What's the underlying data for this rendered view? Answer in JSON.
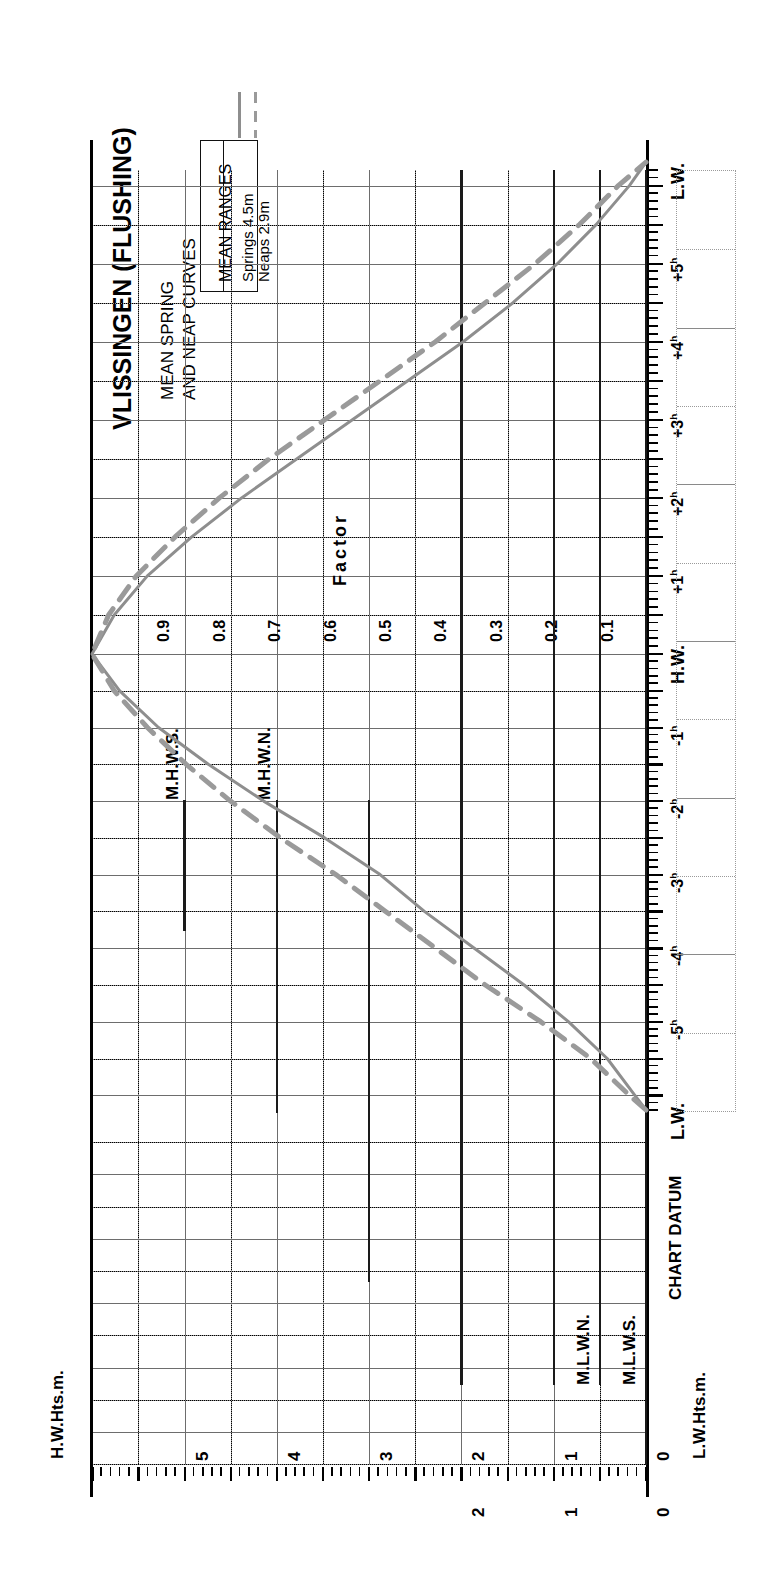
{
  "title": "VLISSINGEN (FLUSHING)",
  "subtitle_line1": "MEAN SPRING",
  "subtitle_line2": "AND NEAP CURVES",
  "legend": {
    "header": "MEAN RANGES",
    "springs_label": "Springs 4.5m",
    "neaps_label": "Neaps  2.9m",
    "springs_style": "solid",
    "neaps_style": "dashed",
    "springs_color": "#8e8e8e",
    "neaps_color": "#9a9a9a"
  },
  "axes": {
    "hw_height_axis_label": "H.W.Hts.m.",
    "lw_height_axis_label": "L.W.Hts.m.",
    "factor_axis_label": "Factor",
    "hw_height_ticks": [
      "0",
      "1",
      "2",
      "3",
      "4",
      "5"
    ],
    "lw_height_ticks": [
      "0",
      "1",
      "2"
    ],
    "factor_ticks": [
      "0.1",
      "0.2",
      "0.3",
      "0.4",
      "0.5",
      "0.6",
      "0.7",
      "0.8",
      "0.9"
    ],
    "time_ticks": [
      "L.W.",
      "+5",
      "+4",
      "+3",
      "+2",
      "+1",
      "H.W.",
      "-1",
      "-2",
      "-3",
      "-4",
      "-5",
      "L.W."
    ],
    "time_unit_superscript": "h"
  },
  "reference_lines": [
    {
      "label": "M.H.W.S.",
      "value": 5.0,
      "side": "hw"
    },
    {
      "label": "M.H.W.N.",
      "value": 4.0,
      "side": "hw"
    },
    {
      "label": "M.L.W.N.",
      "value": 1.0,
      "side": "lw"
    },
    {
      "label": "M.L.W.S.",
      "value": 0.5,
      "side": "lw"
    },
    {
      "label": "CHART DATUM",
      "value": 0.0,
      "side": "datum"
    }
  ],
  "chart_data": {
    "type": "line",
    "xlabel": "Factor",
    "ylabel": "Hours relative to High Water",
    "orientation": "rotated-90",
    "xlim": [
      0,
      1
    ],
    "ylim": [
      -6.2,
      6.3
    ],
    "grid": true,
    "legend_position": "top-left",
    "x": [
      -6.2,
      -6.0,
      -5.5,
      -5.0,
      -4.5,
      -4.0,
      -3.5,
      -3.0,
      -2.5,
      -2.0,
      -1.5,
      -1.0,
      -0.5,
      0.0,
      0.5,
      1.0,
      1.5,
      2.0,
      2.5,
      3.0,
      3.5,
      4.0,
      4.5,
      5.0,
      5.5,
      6.0,
      6.3
    ],
    "series": [
      {
        "name": "Springs 4.5m",
        "style": "solid",
        "color": "#8e8e8e",
        "values": [
          0.0,
          0.02,
          0.07,
          0.14,
          0.22,
          0.31,
          0.4,
          0.48,
          0.58,
          0.69,
          0.79,
          0.88,
          0.95,
          1.0,
          0.96,
          0.9,
          0.82,
          0.73,
          0.63,
          0.53,
          0.43,
          0.33,
          0.24,
          0.16,
          0.09,
          0.03,
          0.0
        ]
      },
      {
        "name": "Neaps 2.9m",
        "style": "dashed",
        "color": "#9a9a9a",
        "values": [
          0.0,
          0.03,
          0.1,
          0.19,
          0.29,
          0.38,
          0.47,
          0.56,
          0.66,
          0.75,
          0.83,
          0.9,
          0.96,
          1.0,
          0.97,
          0.92,
          0.85,
          0.77,
          0.68,
          0.58,
          0.48,
          0.38,
          0.29,
          0.2,
          0.12,
          0.05,
          0.0
        ]
      }
    ],
    "mean_ranges": {
      "springs_m": 4.5,
      "neaps_m": 2.9
    }
  }
}
